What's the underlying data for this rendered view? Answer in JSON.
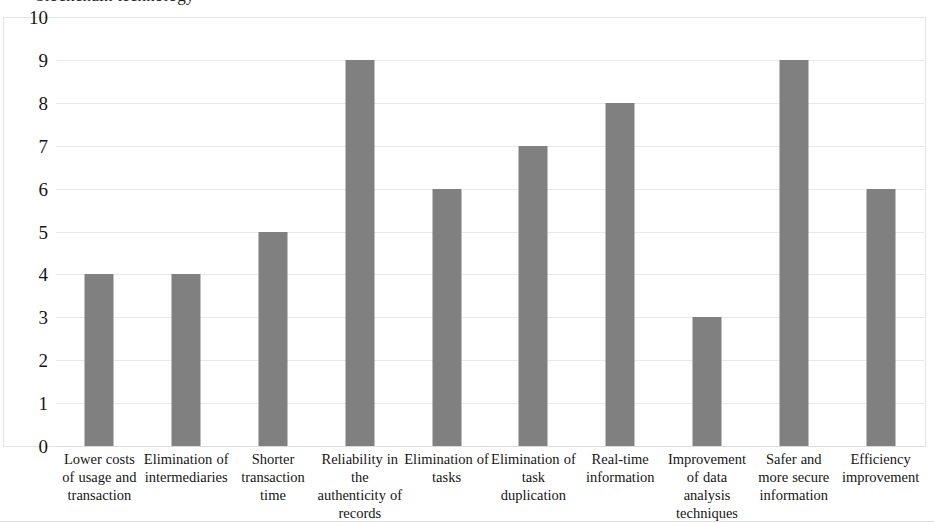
{
  "chart_data": {
    "type": "bar",
    "title": "blockchain technology",
    "title_note": "clipped at top edge of screenshot",
    "xlabel": "",
    "ylabel": "",
    "ylim": [
      0,
      10
    ],
    "ytick_step": 1,
    "yticks": [
      "10",
      "9",
      "8",
      "7",
      "6",
      "5",
      "4",
      "3",
      "2",
      "1",
      "0"
    ],
    "grid": true,
    "legend": "none",
    "bar_color": "#808080",
    "gridline_color": "#e8e8e8",
    "frame_color": "#e3e3e3",
    "categories": [
      "Lower costs of usage and transaction",
      "Elimination of intermediaries",
      "Shorter transaction time",
      "Reliability in the authenticity of records",
      "Elimination of tasks",
      "Elimination of task duplication",
      "Real-time information",
      "Improvement of data analysis techniques",
      "Safer and more secure information",
      "Efficiency improvement"
    ],
    "values": [
      4,
      4,
      5,
      9,
      6,
      7,
      8,
      3,
      9,
      6
    ]
  }
}
